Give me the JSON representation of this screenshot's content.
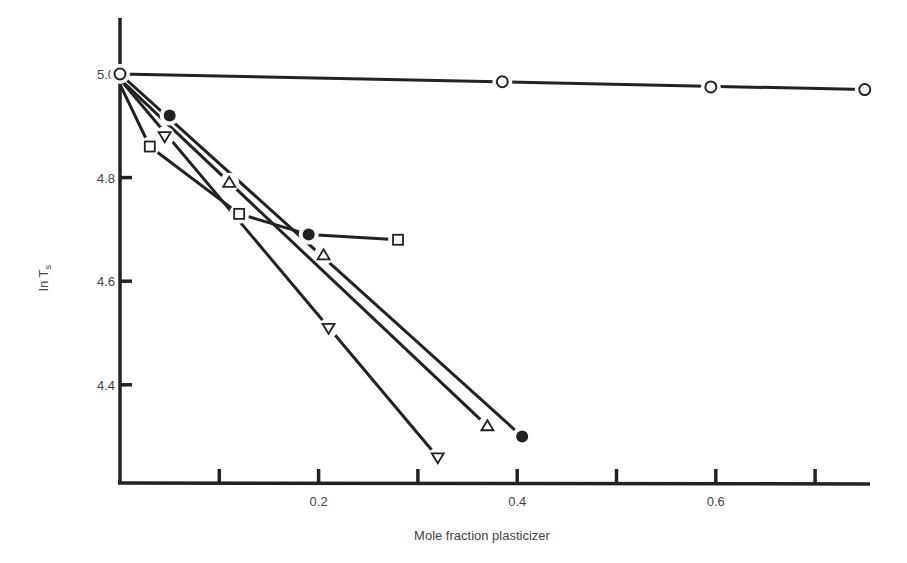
{
  "chart_data": {
    "type": "line",
    "title": "",
    "xlabel": "Mole fraction plasticizer",
    "ylabel": "ln T",
    "ylabel_subscript": "s",
    "xlim": [
      0,
      0.76
    ],
    "ylim": [
      4.22,
      5.1
    ],
    "grid": false,
    "legend": "none",
    "x_ticks": [
      0.1,
      0.2,
      0.3,
      0.4,
      0.5,
      0.6,
      0.7
    ],
    "x_tick_labels": [
      {
        "value": 0.2,
        "label": "0.2"
      },
      {
        "value": 0.4,
        "label": "0.4"
      },
      {
        "value": 0.6,
        "label": "0.6"
      }
    ],
    "y_ticks": [
      {
        "value": 5.0,
        "label": "5.0"
      },
      {
        "value": 4.8,
        "label": "4.8"
      },
      {
        "value": 4.6,
        "label": "4.6"
      },
      {
        "value": 4.4,
        "label": "4.4"
      }
    ],
    "series": [
      {
        "name": "open-circle",
        "marker": "circle-open",
        "x": [
          0.0,
          0.385,
          0.595,
          0.75
        ],
        "y": [
          5.0,
          4.985,
          4.975,
          4.97
        ],
        "line": [
          [
            0.0,
            5.0
          ],
          [
            0.75,
            4.97
          ]
        ]
      },
      {
        "name": "filled-circle",
        "marker": "circle-filled",
        "x": [
          0.05,
          0.19,
          0.405
        ],
        "y": [
          4.92,
          4.69,
          4.3
        ],
        "line": [
          [
            0.0,
            5.0
          ],
          [
            0.405,
            4.3
          ]
        ]
      },
      {
        "name": "up-triangle",
        "marker": "triangle-up-open",
        "x": [
          0.11,
          0.205,
          0.37
        ],
        "y": [
          4.79,
          4.65,
          4.32
        ],
        "line": [
          [
            0.0,
            4.99
          ],
          [
            0.37,
            4.32
          ]
        ]
      },
      {
        "name": "down-triangle",
        "marker": "triangle-down-open",
        "x": [
          0.045,
          0.21,
          0.32
        ],
        "y": [
          4.88,
          4.51,
          4.26
        ],
        "line": [
          [
            0.0,
            4.99
          ],
          [
            0.32,
            4.26
          ]
        ]
      },
      {
        "name": "open-square",
        "marker": "square-open",
        "x": [
          0.03,
          0.12,
          0.28
        ],
        "y": [
          4.86,
          4.73,
          4.68
        ],
        "line": [
          [
            0.0,
            4.98
          ],
          [
            0.03,
            4.86
          ],
          [
            0.12,
            4.73
          ],
          [
            0.19,
            4.69
          ],
          [
            0.28,
            4.68
          ]
        ]
      }
    ]
  }
}
